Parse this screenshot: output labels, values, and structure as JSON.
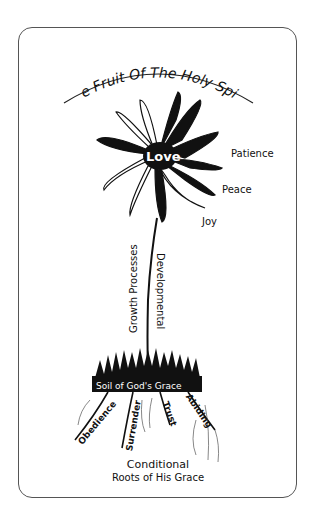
{
  "title": "The Fruit Of The Holy Spirit",
  "flower": {
    "center_label": "Love",
    "fruits": [
      "Patience",
      "Peace",
      "Joy"
    ]
  },
  "stem": {
    "left_label": "Growth Processes",
    "right_label": "Developmental"
  },
  "soil": {
    "label": "Soil of God's Grace"
  },
  "roots": [
    "Obedience",
    "Surrender",
    "Trust",
    "Abiding"
  ],
  "footer": {
    "line1": "Conditional",
    "line2": "Roots of His Grace"
  }
}
